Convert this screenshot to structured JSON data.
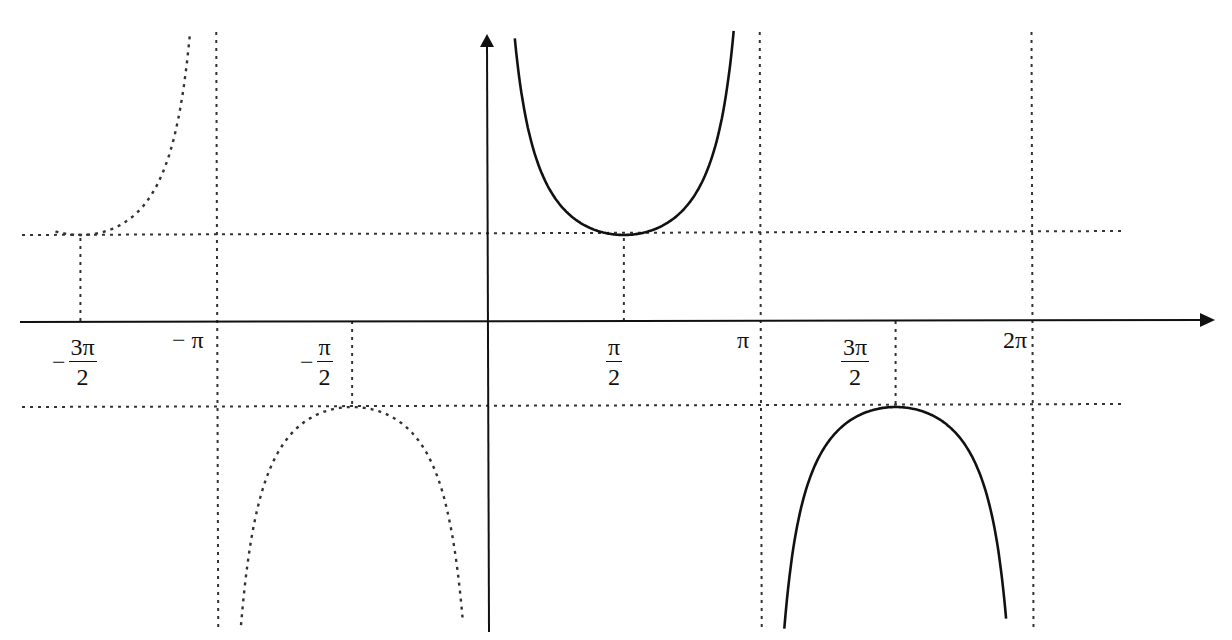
{
  "figure": {
    "x_axis": {
      "arrow": true
    },
    "y_axis": {
      "arrow": true
    }
  },
  "labels": {
    "neg_3pi_2": {
      "sign": "−",
      "num": "3π",
      "den": "2"
    },
    "neg_pi": {
      "text": "− π"
    },
    "neg_pi_2": {
      "sign": "−",
      "num": "π",
      "den": "2"
    },
    "pi_2": {
      "num": "π",
      "den": "2"
    },
    "pi": {
      "text": "π"
    },
    "three_pi_2": {
      "num": "3π",
      "den": "2"
    },
    "two_pi": {
      "text": "2π"
    }
  },
  "chart_data": {
    "type": "line",
    "title": "",
    "function": "y = csc(x) = 1/sin(x)",
    "xlabel": "",
    "ylabel": "",
    "x_ticks": [
      "-3π/2",
      "-π",
      "-π/2",
      "π/2",
      "π",
      "3π/2",
      "2π"
    ],
    "x_tick_values": [
      -4.712,
      -3.1416,
      -1.5708,
      1.5708,
      3.1416,
      4.712,
      6.2832
    ],
    "reference_lines": {
      "horizontal": [
        1,
        -1
      ],
      "vertical_asymptotes": [
        -3.1416,
        3.1416,
        6.2832
      ],
      "vertical_dotted": [
        -4.712,
        -1.5708,
        1.5708,
        4.712
      ]
    },
    "series": [
      {
        "name": "csc x on (-2π,-π) partial",
        "style": "dotted",
        "x_range": [
          -5.0,
          -3.2
        ],
        "min_point": [
          -4.712,
          1
        ]
      },
      {
        "name": "csc x on (-π,0)",
        "style": "dotted",
        "x_range": [
          -3.05,
          -0.05
        ],
        "max_point": [
          -1.5708,
          -1
        ]
      },
      {
        "name": "csc x on (0,π)",
        "style": "solid",
        "x_range": [
          0.05,
          3.1
        ],
        "min_point": [
          1.5708,
          1
        ]
      },
      {
        "name": "csc x on (π,2π)",
        "style": "solid",
        "x_range": [
          3.2,
          6.2
        ],
        "max_point": [
          4.712,
          -1
        ]
      }
    ],
    "grid": false,
    "legend": "none"
  }
}
